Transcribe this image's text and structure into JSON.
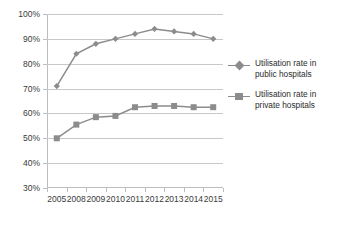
{
  "chart_data": {
    "type": "line",
    "title": "",
    "xlabel": "",
    "ylabel": "",
    "categories": [
      "2005",
      "2008",
      "2009",
      "2010",
      "2011",
      "2012",
      "2013",
      "2014",
      "2015"
    ],
    "ylim": [
      30,
      100
    ],
    "ytick_labels": [
      "100%",
      "90%",
      "80%",
      "70%",
      "60%",
      "50%",
      "40%",
      "30%"
    ],
    "ytick_values": [
      100,
      90,
      80,
      70,
      60,
      50,
      40,
      30
    ],
    "grid": true,
    "legend_position": "right",
    "series": [
      {
        "name": "Utilisation rate in public hospitals",
        "marker": "diamond",
        "color": "#8c8c8c",
        "values": [
          71,
          84,
          88,
          90,
          92,
          94,
          93,
          92,
          90
        ]
      },
      {
        "name": "Utilisation rate in private hospitals",
        "marker": "square",
        "color": "#8c8c8c",
        "values": [
          50,
          55.5,
          58.5,
          59,
          62.5,
          63,
          63,
          62.5,
          62.5
        ]
      }
    ]
  },
  "legend": {
    "entries": [
      {
        "label_line1": "Utilisation rate in",
        "label_line2": "public hospitals",
        "marker": "diamond-marker"
      },
      {
        "label_line1": "Utilisation rate in",
        "label_line2": "private hospitals",
        "marker": "square-marker"
      }
    ]
  },
  "colors": {
    "series": "#8c8c8c",
    "gridline": "#c8c8c8",
    "axis": "#bdbdbd",
    "text": "#3a3a3a",
    "background": "#ffffff"
  }
}
